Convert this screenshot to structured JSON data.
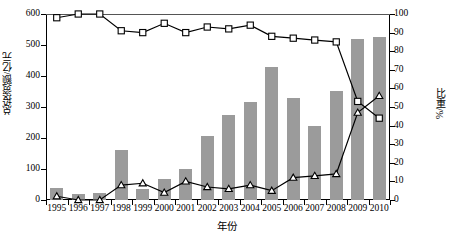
{
  "chart_data": {
    "type": "bar",
    "title": "",
    "xlabel": "年份",
    "ylabel": "总投资额/亿元",
    "y2label": "比重/%",
    "categories": [
      "1995",
      "1996",
      "1997",
      "1998",
      "1999",
      "2000",
      "2001",
      "2002",
      "2003",
      "2004",
      "2005",
      "2006",
      "2007",
      "2008",
      "2009",
      "2010"
    ],
    "ylim": [
      0,
      600
    ],
    "y2lim": [
      0,
      100
    ],
    "yticks": [
      0,
      100,
      200,
      300,
      400,
      500,
      600
    ],
    "y2ticks": [
      0,
      10,
      20,
      30,
      40,
      50,
      60,
      70,
      80,
      90,
      100
    ],
    "grid": false,
    "legend": "none",
    "series": [
      {
        "name": "总投资额",
        "type": "bar",
        "axis": "left",
        "color": "#9b9b9b",
        "values": [
          40,
          20,
          23,
          162,
          37,
          67,
          100,
          205,
          275,
          315,
          428,
          328,
          240,
          352,
          518,
          525
        ]
      },
      {
        "name": "比重-方形",
        "type": "line",
        "axis": "right",
        "marker": "square",
        "color": "#000000",
        "values": [
          98,
          100,
          100,
          91,
          90,
          95,
          90,
          93,
          92,
          94,
          88,
          87,
          86,
          85,
          53,
          44
        ]
      },
      {
        "name": "比重-三角形",
        "type": "line",
        "axis": "right",
        "marker": "triangle",
        "color": "#000000",
        "values": [
          2,
          0,
          0,
          8,
          9,
          4,
          10,
          7,
          6,
          8,
          5,
          12,
          13,
          14,
          47,
          56
        ]
      }
    ]
  }
}
